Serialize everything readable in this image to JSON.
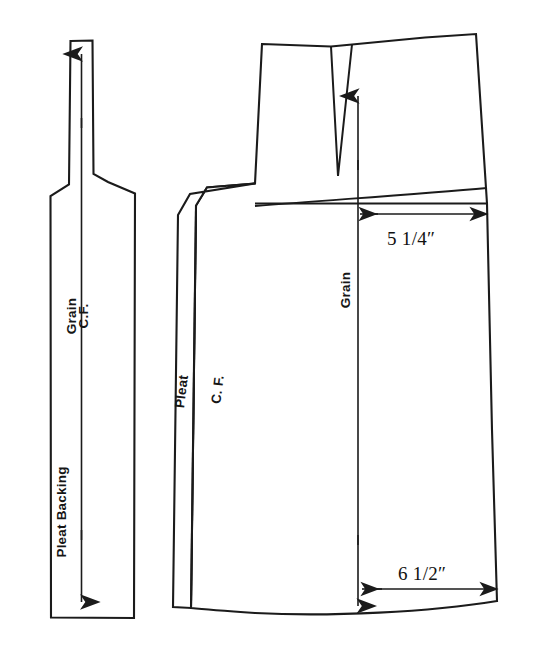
{
  "figure": {
    "type": "technical-pattern-diagram",
    "background_color": "#ffffff",
    "line_color": "#1b1b1b",
    "width": 542,
    "height": 656
  },
  "pieces": {
    "left": {
      "name": "pleat-backing-piece",
      "labels": {
        "grain": "Grain",
        "center_front": "C.F.",
        "piece_name": "Pleat Backing"
      },
      "grain_arrow": {
        "direction": "double-vertical",
        "top_y": 52,
        "bottom_y": 604
      }
    },
    "right": {
      "name": "skirt-front-panel",
      "labels": {
        "grain": "Grain",
        "center_front": "C. F.",
        "pleat": "Pleat"
      },
      "grain_arrow": {
        "direction": "double-vertical",
        "top_y": 94,
        "bottom_y": 608
      },
      "dart": {
        "name": "waist-dart",
        "apex_y": 176
      }
    }
  },
  "measurements": [
    {
      "name": "hip-width",
      "value": "5 1/4″",
      "position": "upper",
      "arrow": "double-horizontal"
    },
    {
      "name": "hem-width",
      "value": "6 1/2″",
      "position": "lower",
      "arrow": "double-horizontal"
    }
  ]
}
